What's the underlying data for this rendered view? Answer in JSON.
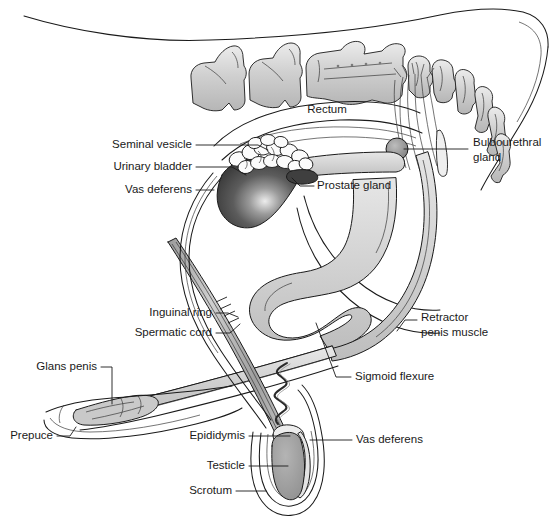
{
  "figure": {
    "background": "#ffffff",
    "line_color": "#1a1a1a",
    "palette": {
      "bladder_dark": "#4a4a4a",
      "bladder_highlight": "#e8e8e8",
      "bone_fill": "#cfcfcf",
      "bone_highlight": "#eaeaea",
      "duct_fill": "#d2d2d2",
      "tissue_light": "#e2e2e2",
      "vesicle_fill": "#fafafa",
      "testicle_fill": "#9e9e9e",
      "epididymis_fill": "#e6e6e6",
      "cord_fill": "#b8b8b8",
      "white": "#ffffff"
    }
  },
  "labels": [
    {
      "id": "seminal-vesicle",
      "text": "Seminal vesicle",
      "text2": "",
      "x": 192,
      "y": 145,
      "align": "end"
    },
    {
      "id": "urinary-bladder",
      "text": "Urinary bladder",
      "text2": "",
      "x": 192,
      "y": 167,
      "align": "end"
    },
    {
      "id": "vas-deferens-upper",
      "text": "Vas deferens",
      "text2": "",
      "x": 192,
      "y": 190,
      "align": "end"
    },
    {
      "id": "rectum",
      "text": "Rectum",
      "text2": "",
      "x": 327,
      "y": 110,
      "align": "middle"
    },
    {
      "id": "bulbourethral-gland",
      "text": "Bulbourethral",
      "text2": "gland",
      "x": 473,
      "y": 143,
      "align": "start"
    },
    {
      "id": "prostate-gland",
      "text": "Prostate gland",
      "text2": "",
      "x": 317,
      "y": 186,
      "align": "start"
    },
    {
      "id": "inguinal-ring",
      "text": "Inguinal ring",
      "text2": "",
      "x": 212,
      "y": 313,
      "align": "end"
    },
    {
      "id": "spermatic-cord",
      "text": "Spermatic cord",
      "text2": "",
      "x": 212,
      "y": 333,
      "align": "end"
    },
    {
      "id": "glans-penis",
      "text": "Glans penis",
      "text2": "",
      "x": 97,
      "y": 367,
      "align": "end"
    },
    {
      "id": "prepuce",
      "text": "Prepuce",
      "text2": "",
      "x": 53,
      "y": 436,
      "align": "end"
    },
    {
      "id": "retractor-penis",
      "text": "Retractor",
      "text2": "penis muscle",
      "x": 421,
      "y": 325,
      "align": "start"
    },
    {
      "id": "sigmoid-flexure",
      "text": "Sigmoid flexure",
      "text2": "",
      "x": 355,
      "y": 377,
      "align": "start"
    },
    {
      "id": "epididymis",
      "text": "Epididymis",
      "text2": "",
      "x": 245,
      "y": 436,
      "align": "end"
    },
    {
      "id": "testicle",
      "text": "Testicle",
      "text2": "",
      "x": 245,
      "y": 466,
      "align": "end"
    },
    {
      "id": "scrotum",
      "text": "Scrotum",
      "text2": "",
      "x": 232,
      "y": 491,
      "align": "end"
    },
    {
      "id": "vas-deferens-lower",
      "text": "Vas deferens",
      "text2": "",
      "x": 356,
      "y": 440,
      "align": "start"
    }
  ],
  "structures": [
    {
      "id": "vertebral-column",
      "name": "Vertebral column / sacrum"
    },
    {
      "id": "rectum-body",
      "name": "Rectum"
    },
    {
      "id": "urinary-bladder-body",
      "name": "Urinary bladder"
    },
    {
      "id": "seminal-vesicle-body",
      "name": "Seminal vesicle"
    },
    {
      "id": "prostate-body",
      "name": "Prostate gland"
    },
    {
      "id": "bulbourethral-body",
      "name": "Bulbourethral gland"
    },
    {
      "id": "urethra-penis",
      "name": "Urethra / penis shaft"
    },
    {
      "id": "sigmoid-flexure-body",
      "name": "Sigmoid flexure"
    },
    {
      "id": "retractor-penis-body",
      "name": "Retractor penis muscle"
    },
    {
      "id": "spermatic-cord-body",
      "name": "Spermatic cord"
    },
    {
      "id": "testicle-body",
      "name": "Testicle"
    },
    {
      "id": "epididymis-body",
      "name": "Epididymis"
    },
    {
      "id": "scrotum-body",
      "name": "Scrotum"
    },
    {
      "id": "glans-body",
      "name": "Glans penis"
    },
    {
      "id": "prepuce-body",
      "name": "Prepuce"
    },
    {
      "id": "tail-outline",
      "name": "Body / tail outline"
    }
  ]
}
